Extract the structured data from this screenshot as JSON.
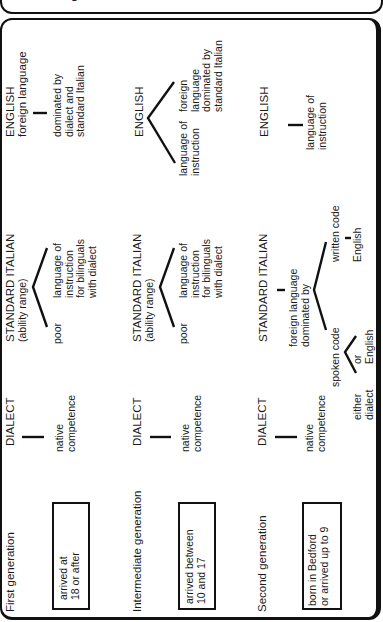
{
  "title": "Multilingualism of Italians in Bedford",
  "generations": [
    {
      "name": "First generation",
      "arrival": [
        "arrived at",
        "18 or after"
      ],
      "dialect": {
        "label": "DIALECT",
        "note": [
          "native",
          "competence"
        ]
      },
      "standard_italian": {
        "label": "STANDARD ITALIAN",
        "sub": "(ability range)",
        "branches": [
          [
            "poor"
          ],
          [
            "language of",
            "instruction",
            "for bilinguals",
            "with dialect"
          ]
        ]
      },
      "english": {
        "label": "ENGLISH",
        "sub": "foreign language",
        "note": [
          "dominated by",
          "dialect and",
          "standard Italian"
        ]
      }
    },
    {
      "name": "Intermediate generation",
      "arrival": [
        "arrived between",
        "10 and 17"
      ],
      "dialect": {
        "label": "DIALECT",
        "note": [
          "native",
          "competence"
        ]
      },
      "standard_italian": {
        "label": "STANDARD ITALIAN",
        "sub": "(ability range)",
        "branches": [
          [
            "poor"
          ],
          [
            "language of",
            "instruction",
            "for bilinguals",
            "with dialect"
          ]
        ]
      },
      "english": {
        "label": "ENGLISH",
        "branches": [
          [
            "language of",
            "instruction"
          ],
          [
            "foreign",
            "language",
            "dominated by",
            "standard Italian"
          ]
        ]
      }
    },
    {
      "name": "Second generation",
      "arrival": [
        "born in Bedford",
        "or arrived up to 9"
      ],
      "dialect": {
        "label": "DIALECT",
        "note": [
          "native",
          "competence"
        ]
      },
      "standard_italian": {
        "label": "STANDARD ITALIAN",
        "note": [
          "foreign language",
          "dominated by"
        ],
        "spoken": {
          "label": "spoken code",
          "options": [
            [
              "either",
              "dialect"
            ],
            [
              "or",
              "English"
            ]
          ]
        },
        "written": {
          "label": "written code",
          "value": "English"
        }
      },
      "english": {
        "label": "ENGLISH",
        "note": [
          "language of",
          "instruction"
        ]
      }
    }
  ]
}
